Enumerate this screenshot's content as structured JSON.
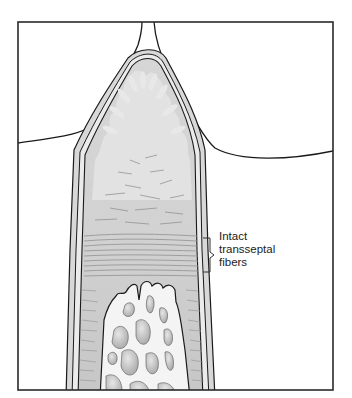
{
  "figure": {
    "colors": {
      "frame": "#2a2a2a",
      "outline": "#1a1a1a",
      "papilla_fill": "#cfcfcf",
      "papilla_inner": "#e0e0e0",
      "fiber_zone": "#c4c4c4",
      "bone_fill": "#f2f2f2",
      "marrow_spaces": "#bdbdbd",
      "background": "#ffffff"
    }
  },
  "annotation": {
    "line1": "Intact",
    "line2": "transseptal",
    "line3": "fibers",
    "bracket_icon": "curly-brace-icon"
  }
}
